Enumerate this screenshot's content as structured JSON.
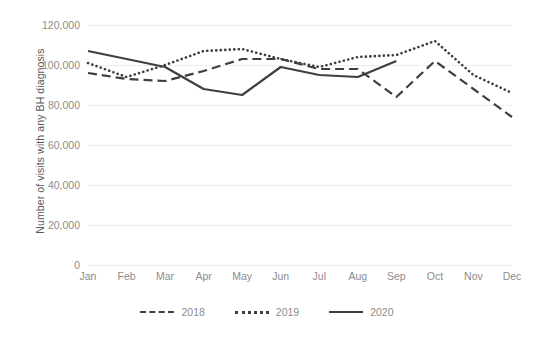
{
  "chart_data": {
    "type": "line",
    "title": "",
    "xlabel": "",
    "ylabel": "Number of visits with any BH diagnosis",
    "categories": [
      "Jan",
      "Feb",
      "Mar",
      "Apr",
      "May",
      "Jun",
      "Jul",
      "Aug",
      "Sep",
      "Oct",
      "Nov",
      "Dec"
    ],
    "ylim": [
      0,
      120000
    ],
    "ytick_values": [
      0,
      20000,
      40000,
      60000,
      80000,
      100000,
      120000
    ],
    "ytick_labels": [
      "0",
      "20,000",
      "40,000",
      "60,000",
      "80,000",
      "100,000",
      "120,000"
    ],
    "grid": true,
    "legend_position": "bottom",
    "series": [
      {
        "name": "2018",
        "style": "dashed",
        "color": "#3f3f3f",
        "values": [
          96000,
          93000,
          92000,
          97000,
          103000,
          103000,
          98000,
          98000,
          84000,
          102000,
          88000,
          74000
        ]
      },
      {
        "name": "2019",
        "style": "dotted",
        "color": "#3f3f3f",
        "values": [
          101000,
          94000,
          100000,
          107000,
          108000,
          103000,
          99000,
          104000,
          105000,
          112000,
          95000,
          86000
        ]
      },
      {
        "name": "2020",
        "style": "solid",
        "color": "#3f3f3f",
        "values": [
          107000,
          103000,
          99000,
          88000,
          85000,
          99000,
          95000,
          94000,
          102000,
          null,
          null,
          null
        ]
      }
    ]
  },
  "axes": {
    "y_title": "Number of visits with any BH diagnosis"
  },
  "legend": {
    "items": [
      {
        "label": "2018",
        "style": "dashed"
      },
      {
        "label": "2019",
        "style": "dotted"
      },
      {
        "label": "2020",
        "style": "solid"
      }
    ]
  }
}
